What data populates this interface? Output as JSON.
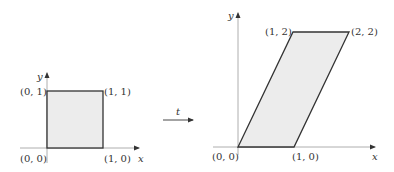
{
  "colors": {
    "background": "#ffffff",
    "shape_fill": "#ececec",
    "shape_stroke": "#333333",
    "axis": "#888888",
    "text": "#333333"
  },
  "left_figure": {
    "shape": "unit square",
    "vertices": [
      "(0,0)",
      "(1,0)",
      "(1,1)",
      "(0,1)"
    ],
    "labels": {
      "origin": "(0, 0)",
      "x1": "(1, 0)",
      "y1": "(0, 1)",
      "corner": "(1, 1)",
      "x_axis": "x",
      "y_axis": "y"
    }
  },
  "transform": {
    "label": "t"
  },
  "right_figure": {
    "shape": "parallelogram",
    "vertices": [
      "(0,0)",
      "(1,0)",
      "(2,2)",
      "(1,2)"
    ],
    "labels": {
      "origin": "(0, 0)",
      "x1": "(1, 0)",
      "top_left": "(1, 2)",
      "top_right": "(2, 2)",
      "x_axis": "x",
      "y_axis": "y"
    }
  }
}
